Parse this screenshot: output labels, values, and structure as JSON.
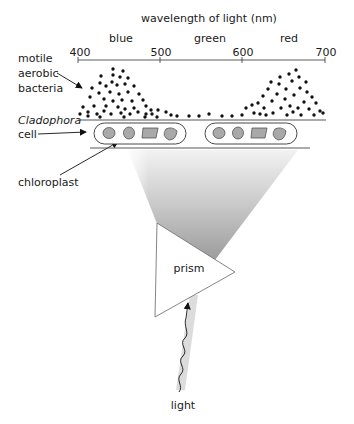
{
  "title": "wavelength of light (nm)",
  "colors": {
    "blue": "blue",
    "green": "green",
    "red": "red"
  },
  "color_labels": [
    "blue",
    "green",
    "red"
  ],
  "axis": {
    "ticks": [
      "400",
      "500",
      "600",
      "700"
    ]
  },
  "labels": {
    "bacteria_1": "motile",
    "bacteria_2": "aerobic",
    "bacteria_3": "bacteria",
    "cell_1": "Cladophora",
    "cell_2": "cell",
    "chloroplast": "chloroplast",
    "prism": "prism",
    "light": "light"
  }
}
